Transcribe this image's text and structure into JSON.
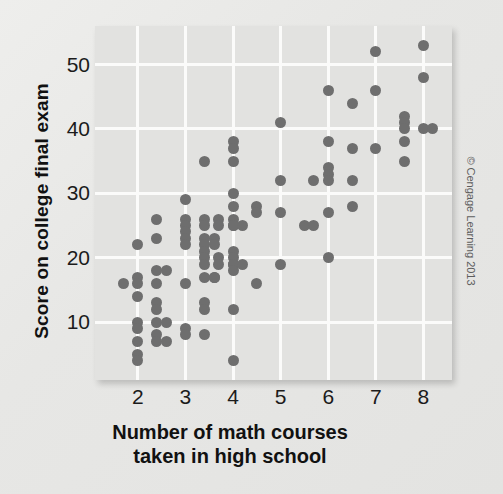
{
  "axes": {
    "x_title": "Number of math courses",
    "x_title_line2": "taken in high school",
    "y_title": "Score on college final exam"
  },
  "credit": "© Cengage Learning 2013",
  "colors": {
    "dot": "#6e6e6e",
    "panel": "#e2e2e0",
    "grid": "#fbfbfa",
    "background": "#e9e9e7",
    "text": "#1b1b1b"
  },
  "chart_data": {
    "type": "scatter",
    "title": "",
    "xlabel": "Number of math courses taken in high school",
    "ylabel": "Score on college final exam",
    "xlim": [
      1.1,
      8.6
    ],
    "ylim": [
      1.0,
      56.0
    ],
    "xticks": [
      2,
      3,
      4,
      5,
      6,
      7,
      8
    ],
    "xticklabels": [
      "2",
      "3",
      "4",
      "5",
      "6",
      "7",
      "8"
    ],
    "yticks": [
      10,
      20,
      30,
      40,
      50
    ],
    "yticklabels": [
      "10",
      "20",
      "30",
      "40",
      "50"
    ],
    "grid": true,
    "legend": null,
    "points": [
      [
        1.7,
        16
      ],
      [
        2.0,
        22
      ],
      [
        2.0,
        17
      ],
      [
        2.0,
        16
      ],
      [
        2.0,
        14
      ],
      [
        2.0,
        10
      ],
      [
        2.0,
        9
      ],
      [
        2.0,
        7
      ],
      [
        2.0,
        5
      ],
      [
        2.0,
        4
      ],
      [
        2.4,
        26
      ],
      [
        2.4,
        23
      ],
      [
        2.4,
        18
      ],
      [
        2.4,
        16
      ],
      [
        2.4,
        13
      ],
      [
        2.4,
        12
      ],
      [
        2.4,
        10
      ],
      [
        2.4,
        8
      ],
      [
        2.4,
        7
      ],
      [
        2.6,
        18
      ],
      [
        2.6,
        10
      ],
      [
        2.6,
        7
      ],
      [
        3.0,
        29
      ],
      [
        3.0,
        26
      ],
      [
        3.0,
        25
      ],
      [
        3.0,
        24
      ],
      [
        3.0,
        23
      ],
      [
        3.0,
        22
      ],
      [
        3.0,
        16
      ],
      [
        3.0,
        9
      ],
      [
        3.0,
        8
      ],
      [
        3.4,
        35
      ],
      [
        3.4,
        26
      ],
      [
        3.4,
        25
      ],
      [
        3.4,
        23
      ],
      [
        3.4,
        22
      ],
      [
        3.4,
        21
      ],
      [
        3.4,
        20
      ],
      [
        3.4,
        19
      ],
      [
        3.4,
        17
      ],
      [
        3.4,
        13
      ],
      [
        3.4,
        12
      ],
      [
        3.4,
        8
      ],
      [
        3.6,
        23
      ],
      [
        3.6,
        22
      ],
      [
        3.6,
        17
      ],
      [
        3.6,
        17
      ],
      [
        3.7,
        26
      ],
      [
        3.7,
        25
      ],
      [
        3.7,
        20
      ],
      [
        3.7,
        19
      ],
      [
        4.0,
        38
      ],
      [
        4.0,
        37
      ],
      [
        4.0,
        35
      ],
      [
        4.0,
        30
      ],
      [
        4.0,
        28
      ],
      [
        4.0,
        26
      ],
      [
        4.0,
        25
      ],
      [
        4.0,
        25
      ],
      [
        4.0,
        21
      ],
      [
        4.0,
        20
      ],
      [
        4.0,
        19
      ],
      [
        4.0,
        19
      ],
      [
        4.0,
        18
      ],
      [
        4.0,
        12
      ],
      [
        4.0,
        4
      ],
      [
        4.2,
        25
      ],
      [
        4.2,
        19
      ],
      [
        4.5,
        28
      ],
      [
        4.5,
        27
      ],
      [
        4.5,
        16
      ],
      [
        5.0,
        41
      ],
      [
        5.0,
        32
      ],
      [
        5.0,
        27
      ],
      [
        5.0,
        19
      ],
      [
        5.5,
        25
      ],
      [
        5.7,
        25
      ],
      [
        5.7,
        32
      ],
      [
        6.0,
        46
      ],
      [
        6.0,
        38
      ],
      [
        6.0,
        34
      ],
      [
        6.0,
        33
      ],
      [
        6.0,
        32
      ],
      [
        6.0,
        27
      ],
      [
        6.0,
        20
      ],
      [
        6.5,
        44
      ],
      [
        6.5,
        37
      ],
      [
        6.5,
        32
      ],
      [
        6.5,
        28
      ],
      [
        7.0,
        52
      ],
      [
        7.0,
        46
      ],
      [
        7.0,
        37
      ],
      [
        7.6,
        42
      ],
      [
        7.6,
        41
      ],
      [
        7.6,
        40
      ],
      [
        7.6,
        38
      ],
      [
        7.6,
        35
      ],
      [
        8.0,
        53
      ],
      [
        8.0,
        48
      ],
      [
        8.0,
        40
      ],
      [
        8.2,
        40
      ]
    ]
  }
}
